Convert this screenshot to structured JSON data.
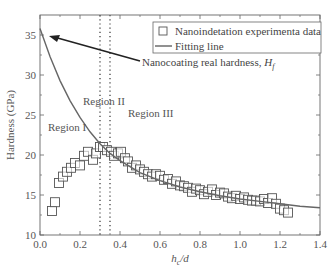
{
  "chart_data": {
    "type": "scatter",
    "title": "",
    "xlabel": "h_c/d",
    "ylabel": "Hardness (GPa)",
    "xlim": [
      0.0,
      1.4
    ],
    "ylim": [
      10,
      37.5
    ],
    "xticks": [
      "0.0",
      "0.2",
      "0.4",
      "0.6",
      "0.8",
      "1.0",
      "1.2",
      "1.4"
    ],
    "yticks": [
      "10",
      "15",
      "20",
      "25",
      "30",
      "35"
    ],
    "grid": false,
    "legend_position": "upper right",
    "legend": [
      "Nanoindetation experimenta data",
      "Fitting line"
    ],
    "series": [
      {
        "name": "Nanoindetation experimenta data",
        "marker": "open-square",
        "x": [
          0.06,
          0.075,
          0.095,
          0.115,
          0.135,
          0.155,
          0.175,
          0.2,
          0.22,
          0.24,
          0.265,
          0.28,
          0.3,
          0.315,
          0.335,
          0.355,
          0.37,
          0.39,
          0.405,
          0.425,
          0.44,
          0.46,
          0.48,
          0.5,
          0.52,
          0.54,
          0.56,
          0.58,
          0.6,
          0.62,
          0.64,
          0.66,
          0.68,
          0.7,
          0.72,
          0.74,
          0.76,
          0.78,
          0.8,
          0.82,
          0.84,
          0.86,
          0.88,
          0.9,
          0.92,
          0.94,
          0.96,
          0.98,
          1.0,
          1.02,
          1.04,
          1.06,
          1.08,
          1.1,
          1.12,
          1.14,
          1.16,
          1.18,
          1.2,
          1.22,
          1.24
        ],
        "y": [
          13.0,
          14.1,
          16.5,
          17.3,
          17.9,
          18.4,
          19.0,
          18.7,
          19.9,
          20.4,
          19.4,
          20.2,
          21.0,
          21.0,
          20.6,
          20.4,
          19.9,
          20.2,
          20.4,
          19.6,
          19.2,
          18.4,
          18.7,
          18.2,
          17.9,
          17.6,
          17.3,
          17.6,
          17.4,
          16.9,
          17.0,
          16.4,
          16.7,
          16.2,
          16.1,
          15.9,
          15.4,
          15.8,
          15.6,
          15.1,
          15.4,
          15.7,
          15.0,
          15.3,
          15.2,
          14.8,
          14.6,
          14.9,
          14.5,
          14.7,
          14.4,
          14.3,
          14.3,
          14.2,
          14.5,
          14.0,
          14.6,
          13.9,
          13.3,
          13.1,
          12.8
        ]
      },
      {
        "name": "Fitting line",
        "marker": "none",
        "x": [
          0.0,
          0.05,
          0.1,
          0.15,
          0.2,
          0.25,
          0.3,
          0.35,
          0.4,
          0.5,
          0.6,
          0.7,
          0.8,
          0.9,
          1.0,
          1.1,
          1.2,
          1.3,
          1.4
        ],
        "y": [
          35.8,
          32.3,
          29.3,
          26.8,
          24.7,
          22.9,
          21.4,
          20.2,
          19.3,
          17.8,
          16.8,
          16.0,
          15.4,
          14.9,
          14.5,
          14.2,
          13.9,
          13.6,
          13.4
        ]
      }
    ],
    "vertical_lines": [
      {
        "x": 0.3,
        "style": "dotted"
      },
      {
        "x": 0.35,
        "style": "dotted"
      }
    ],
    "annotations": [
      {
        "text": "Region I",
        "x": 0.12,
        "y": 23.5
      },
      {
        "text": "Region II",
        "x": 0.32,
        "y": 26.0
      },
      {
        "text": "Region III",
        "x": 0.52,
        "y": 24.5
      },
      {
        "text": "Nanocoating real hardness, H_f",
        "arrow_to": {
          "x": 0.03,
          "y": 35.5
        },
        "text_pos": {
          "x": 0.62,
          "y": 30.8
        }
      }
    ]
  },
  "labels": {
    "xlabel_main": "h",
    "xlabel_sub": "c",
    "xlabel_rest": "/d",
    "ylabel": "Hardness (GPa)",
    "region1": "Region I",
    "region2": "Region II",
    "region3": "Region III",
    "annotation_main": "Nanocoating real hardness, ",
    "annotation_var": "H",
    "annotation_sub": "f",
    "legend_data": "Nanoindetation experimenta data",
    "legend_fit": "Fitting line"
  }
}
